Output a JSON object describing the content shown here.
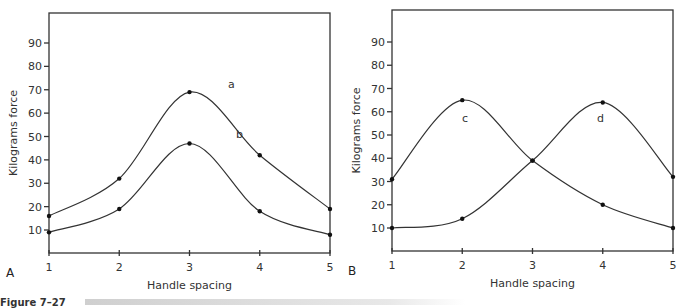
{
  "caption": "Figure 7–27",
  "chart_data": [
    {
      "type": "line",
      "panel": "A",
      "xlabel": "Handle spacing",
      "ylabel": "Kilograms force",
      "x": [
        1,
        2,
        3,
        4,
        5
      ],
      "yticks": [
        10,
        20,
        30,
        40,
        50,
        60,
        70,
        80,
        90
      ],
      "ylim": [
        0,
        100
      ],
      "series": [
        {
          "name": "a",
          "values": [
            16,
            32,
            69,
            42,
            19
          ]
        },
        {
          "name": "b",
          "values": [
            9,
            19,
            47,
            18,
            8
          ]
        }
      ]
    },
    {
      "type": "line",
      "panel": "B",
      "xlabel": "Handle spacing",
      "ylabel": "Kilograms force",
      "x": [
        1,
        2,
        3,
        4,
        5
      ],
      "yticks": [
        10,
        20,
        30,
        40,
        50,
        60,
        70,
        80,
        90
      ],
      "ylim": [
        0,
        100
      ],
      "series": [
        {
          "name": "c",
          "values": [
            31,
            65,
            39,
            20,
            10
          ]
        },
        {
          "name": "d",
          "values": [
            10,
            14,
            39,
            64,
            32
          ]
        }
      ]
    }
  ]
}
